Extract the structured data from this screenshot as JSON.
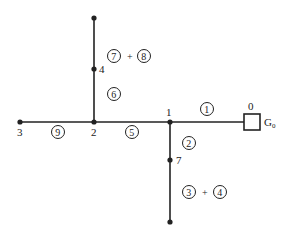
{
  "diagram": {
    "type": "radial distribution network tree",
    "nodes": [
      {
        "id": "0",
        "label": "0",
        "x": 252,
        "y": 122,
        "kind": "source"
      },
      {
        "id": "1",
        "label": "1",
        "x": 170,
        "y": 122
      },
      {
        "id": "2",
        "label": "2",
        "x": 94,
        "y": 122
      },
      {
        "id": "3",
        "label": "3",
        "x": 20,
        "y": 122
      },
      {
        "id": "4",
        "label": "4",
        "x": 94,
        "y": 69
      },
      {
        "id": "7",
        "label": "7",
        "x": 170,
        "y": 160
      },
      {
        "id": "top",
        "label": "",
        "x": 94,
        "y": 18
      },
      {
        "id": "bottom",
        "label": "",
        "x": 170,
        "y": 222
      }
    ],
    "source_label": "G",
    "source_subscript": "0",
    "edges": [
      {
        "from": "0",
        "to": "1",
        "circled": [
          "1"
        ]
      },
      {
        "from": "1",
        "to": "2",
        "circled": [
          "5"
        ]
      },
      {
        "from": "2",
        "to": "3",
        "circled": [
          "9"
        ]
      },
      {
        "from": "2",
        "to": "4",
        "circled": [
          "6"
        ]
      },
      {
        "from": "4",
        "to": "top",
        "circled": [
          "7",
          "8"
        ]
      },
      {
        "from": "1",
        "to": "7",
        "circled": [
          "2"
        ]
      },
      {
        "from": "7",
        "to": "bottom",
        "circled": [
          "3",
          "4"
        ]
      }
    ],
    "plus": "+"
  }
}
